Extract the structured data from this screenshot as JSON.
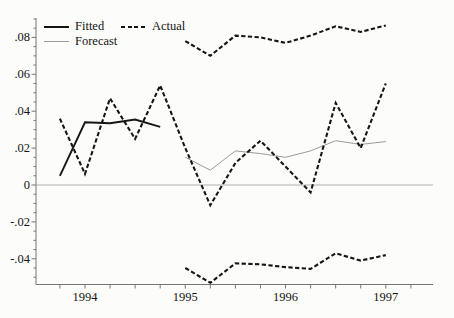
{
  "figure": {
    "background": "#fcfcfa",
    "text_color": "#141414",
    "axis_color": "#777777",
    "zero_line_color": "#b0b0b0",
    "series_color": "#161616",
    "forecast_color": "#9a9a9a",
    "legend": {
      "items": [
        {
          "label": "Fitted",
          "style": "solid"
        },
        {
          "label": "Actual",
          "style": "dashed"
        },
        {
          "label": "Forecast",
          "style": "thin"
        }
      ],
      "position": "top-left-inside"
    }
  },
  "chart_data": {
    "type": "line",
    "title": "",
    "xlabel": "",
    "ylabel": "",
    "x_unit": "quarterly",
    "x_start": "1993Q4",
    "x_end": "1997Q1",
    "quarters": [
      "1993Q4",
      "1994Q1",
      "1994Q2",
      "1994Q3",
      "1994Q4",
      "1995Q1",
      "1995Q2",
      "1995Q3",
      "1995Q4",
      "1996Q1",
      "1996Q2",
      "1996Q3",
      "1996Q4",
      "1997Q1"
    ],
    "x_tick_labels": [
      {
        "label": "1994",
        "index": 1
      },
      {
        "label": "1995",
        "index": 5
      },
      {
        "label": "1996",
        "index": 9
      },
      {
        "label": "1997",
        "index": 13
      }
    ],
    "y_ticks": [
      {
        "label": ".08",
        "value": 0.08
      },
      {
        "label": ".06",
        "value": 0.06
      },
      {
        "label": ".04",
        "value": 0.04
      },
      {
        "label": ".02",
        "value": 0.02
      },
      {
        "label": "0",
        "value": 0.0
      },
      {
        "label": "-.02",
        "value": -0.02
      },
      {
        "label": "-.04",
        "value": -0.04
      }
    ],
    "y_minor_step": 0.005,
    "ylim": [
      -0.055,
      0.09
    ],
    "grid": "zero-line-only",
    "legend_position": "top-left-inside",
    "series": [
      {
        "name": "Fitted",
        "line_style": "solid",
        "start_index": 0,
        "values": [
          0.005,
          0.034,
          0.0335,
          0.0355,
          0.0315
        ]
      },
      {
        "name": "Actual",
        "line_style": "dashed",
        "start_index": 0,
        "values": [
          0.036,
          0.006,
          0.047,
          0.025,
          0.054,
          0.02,
          -0.011,
          0.012,
          0.024,
          0.01,
          -0.004,
          0.0445,
          0.02,
          0.055
        ]
      },
      {
        "name": "Forecast",
        "line_style": "thin",
        "start_index": 5,
        "values": [
          0.015,
          0.008,
          0.0185,
          0.017,
          0.015,
          0.0185,
          0.024,
          0.022,
          0.0235
        ]
      },
      {
        "name": "upper-band",
        "line_style": "dashed",
        "start_index": 5,
        "values": [
          0.078,
          0.07,
          0.081,
          0.08,
          0.077,
          0.081,
          0.086,
          0.083,
          0.0865
        ]
      },
      {
        "name": "lower-band",
        "line_style": "dashed",
        "start_index": 5,
        "values": [
          -0.045,
          -0.053,
          -0.0425,
          -0.043,
          -0.0445,
          -0.0455,
          -0.037,
          -0.041,
          -0.038
        ]
      }
    ]
  }
}
